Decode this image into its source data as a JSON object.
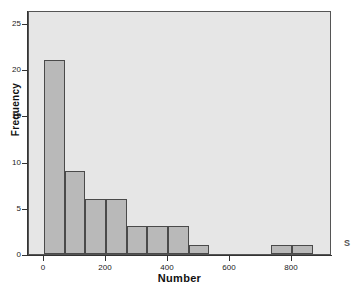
{
  "chart_data": {
    "type": "bar",
    "title": "",
    "subtitle": "",
    "xlabel": "Number",
    "ylabel": "Frequency",
    "xlim": [
      -70,
      910
    ],
    "ylim": [
      0,
      26.5
    ],
    "grid": false,
    "legend": null,
    "bin_width": 67,
    "categories": [
      "0-67",
      "67-133",
      "133-200",
      "200-267",
      "267-333",
      "333-400",
      "400-467",
      "467-533",
      "533-600",
      "600-667",
      "667-733",
      "733-800",
      "800-867"
    ],
    "bin_starts": [
      0,
      67,
      133,
      200,
      267,
      333,
      400,
      467,
      533,
      600,
      667,
      733,
      800
    ],
    "bin_ends": [
      67,
      133,
      200,
      267,
      333,
      400,
      467,
      533,
      600,
      667,
      733,
      800,
      867
    ],
    "values": [
      21,
      9,
      6,
      6,
      3,
      3,
      3,
      1,
      0,
      0,
      0,
      1,
      1
    ],
    "x_ticks": [
      0,
      200,
      400,
      600,
      800
    ],
    "x_tick_labels": [
      "0",
      "200",
      "400",
      "600",
      "800"
    ],
    "y_ticks": [
      0,
      5,
      10,
      15,
      20,
      25
    ],
    "y_tick_labels": [
      "0",
      "5",
      "10",
      "15",
      "20",
      "25"
    ],
    "colors": {
      "bar_fill": "#b9b9b9",
      "bar_edge": "#4a4a4a",
      "plot_background": "#e6e6e6",
      "figure_background": "#ffffff",
      "axis": "#333333",
      "text": "#111111"
    }
  },
  "annotations": {
    "corner_glyph": "S"
  }
}
